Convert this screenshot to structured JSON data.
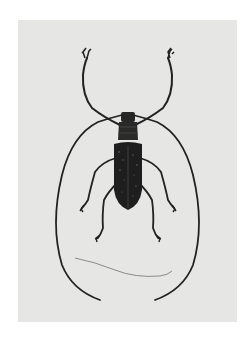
{
  "image": {
    "subject": "longhorn beetle specimen illustration",
    "style": "grayscale",
    "colors": {
      "margin": "#ffffff",
      "paper": "#e6e6e4",
      "beetle": "#1e1e1e",
      "hair": "#8a8a8a"
    }
  }
}
